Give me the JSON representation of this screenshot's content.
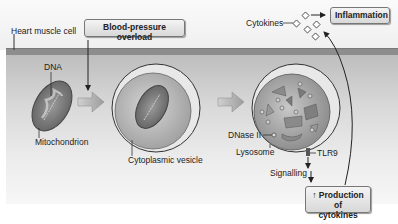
{
  "diagram": {
    "labels": {
      "heart_muscle_cell": "Heart muscle cell",
      "dna": "DNA",
      "mitochondrion": "Mitochondrion",
      "cytoplasmic_vesicle": "Cytoplasmic vesicle",
      "dnase_ii": "DNase II",
      "lysosome": "Lysosome",
      "tlr9": "TLR9",
      "signalling": "Signalling",
      "cytokines": "Cytokines"
    },
    "boxes": {
      "blood_pressure_overload": "Blood-pressure overload",
      "inflammation": "Inflammation",
      "production_line1": "↑ Production of",
      "production_line2": "cytokines"
    },
    "stages": [
      {
        "name": "mitochondrion-in-cytoplasm"
      },
      {
        "name": "autophagic-vesicle-engulfing-mitochondrion"
      },
      {
        "name": "lysosome-degrading-mitochondrion"
      }
    ],
    "colors": {
      "membrane": "#8d8d8d",
      "cytoplasm_top": "#bdbdbd",
      "box_fill": "#e6e6e6",
      "arrow_fill": "#a8a8a8"
    }
  }
}
